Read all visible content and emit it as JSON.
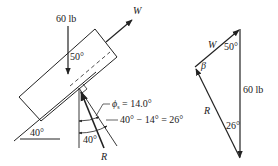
{
  "free_body": {
    "load_label": "60 lb",
    "w_label": "W",
    "angle_block": "50°",
    "incline_angle": "40°",
    "phi_label": "ϕ",
    "phi_sub": "s",
    "phi_value": " = 14.0°",
    "diff_label": "40° − 14° = 26°",
    "angle_lower": "40°",
    "r_label": "R"
  },
  "force_triangle": {
    "w_label": "W",
    "angle_top": "50°",
    "beta_label": "β",
    "load_label": "60 lb",
    "r_label": "R",
    "angle_bottom": "26°"
  },
  "colors": {
    "ink": "#222222",
    "background": "#ffffff"
  }
}
